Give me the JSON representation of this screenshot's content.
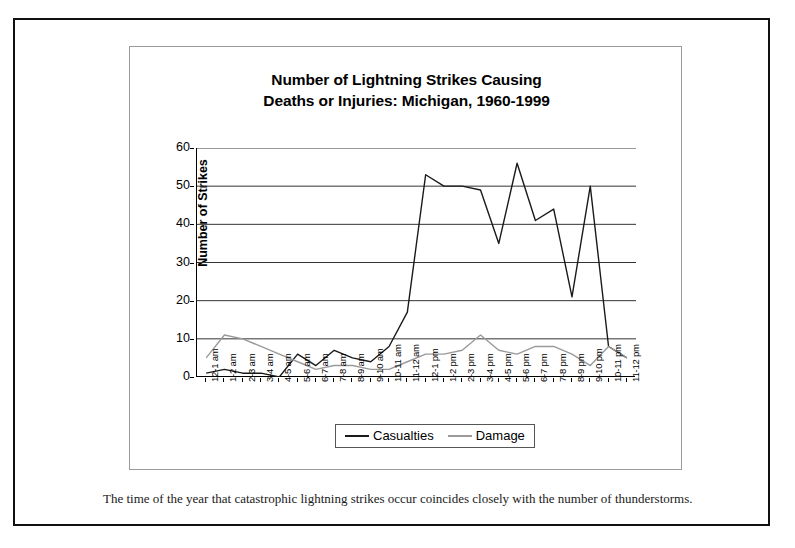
{
  "document": {
    "caption": "The time of the year that catastrophic lightning strikes occur coincides closely with the number of thunderstorms."
  },
  "chart_data": {
    "type": "line",
    "title": "Number of Lightning Strikes Causing Deaths or Injuries: Michigan, 1960-1999",
    "title_line1": "Number of Lightning Strikes Causing",
    "title_line2": "Deaths or Injuries: Michigan, 1960-1999",
    "xlabel": "",
    "ylabel": "Number of Strikes",
    "ylim": [
      0,
      60
    ],
    "ytick_step": 10,
    "yticks": [
      0,
      10,
      20,
      30,
      40,
      50,
      60
    ],
    "ytick_labels": [
      "0",
      "10",
      "20",
      "30",
      "40",
      "50",
      "60"
    ],
    "grid": true,
    "grid_axis": "y",
    "legend_position": "bottom",
    "categories": [
      "12-1 am",
      "1-2 am",
      "2-3 am",
      "3-4 am",
      "4-5 am",
      "5-6 am",
      "6-7 am",
      "7-8 am",
      "8-9 am",
      "9-10 am",
      "10-11 am",
      "11-12 am",
      "12-1 pm",
      "1-2 pm",
      "2-3 pm",
      "3-4 pm",
      "4-5 pm",
      "5-6 pm",
      "6-7 pm",
      "7-8 pm",
      "8-9 pm",
      "9-10 pm",
      "10-11 pm",
      "11-12 pm"
    ],
    "series": [
      {
        "name": "Casualties",
        "color": "#1a1a1a",
        "values": [
          1,
          2,
          1,
          1,
          0,
          6,
          3,
          7,
          5,
          4,
          8,
          17,
          53,
          50,
          50,
          49,
          35,
          56,
          41,
          44,
          21,
          50,
          8,
          5
        ]
      },
      {
        "name": "Damage",
        "color": "#9a9a9a",
        "values": [
          5,
          11,
          10,
          8,
          6,
          4,
          2,
          3,
          3,
          2,
          2,
          4,
          6,
          6,
          7,
          11,
          7,
          6,
          8,
          8,
          6,
          3,
          8,
          5
        ]
      }
    ]
  },
  "legend": {
    "items": [
      {
        "label": "Casualties",
        "color": "#1a1a1a"
      },
      {
        "label": "Damage",
        "color": "#9a9a9a"
      }
    ]
  }
}
